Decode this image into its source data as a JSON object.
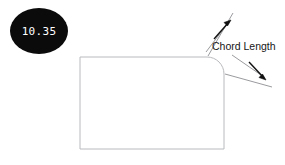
{
  "canvas": {
    "width": 285,
    "height": 165,
    "background_color": "#ffffff"
  },
  "badge": {
    "name": "radius-value-badge",
    "value": "10.35",
    "fill_color": "#0b0b0b",
    "text_color": "#ffffff",
    "shape": "circle"
  },
  "shape": {
    "name": "rounded-rectangle-profile",
    "stroke_color": "#b9babd",
    "fill_color": "#ffffff",
    "corner_style": "top-right-rounded",
    "x": 80,
    "y": 57,
    "width": 144,
    "height": 92,
    "corner_radius": 17
  },
  "annotation": {
    "name": "chord-length-dimension",
    "label": "Chord Length",
    "label_color": "#161616",
    "leader_color": "#9a9b9e",
    "arrow_color": "#111111",
    "arrow_count": 2,
    "arrow_directions": [
      "up-right",
      "down-right"
    ]
  },
  "icons": {
    "arrowhead_up": "arrow-up-right-icon",
    "arrowhead_down": "arrow-down-right-icon"
  }
}
